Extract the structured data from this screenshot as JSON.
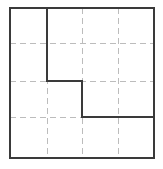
{
  "figure": {
    "canvas": {
      "width": 163,
      "height": 169,
      "background": "#ffffff"
    },
    "colors": {
      "solid_line": "#3a3a3a",
      "dashed_line": "#bcbcbc",
      "fill": "#ffffff"
    },
    "stroke_widths": {
      "solid": 1.6,
      "dashed": 1
    },
    "dash_pattern": "6 4"
  },
  "chart_data": {
    "type": "diagram",
    "title": "",
    "xlabel": "",
    "ylabel": "",
    "grid": true,
    "legend": null,
    "plot_box": {
      "x0": 10,
      "y0": 8,
      "x1": 154,
      "y1": 158
    },
    "grid_columns": 4,
    "grid_rows": 4,
    "grid_vertical_x": [
      47,
      82,
      118
    ],
    "grid_horizontal_y": [
      43,
      81,
      117
    ],
    "outer_square": [
      [
        10,
        8
      ],
      [
        154,
        8
      ],
      [
        154,
        158
      ],
      [
        10,
        158
      ]
    ],
    "staircase_polyline": [
      [
        47,
        8
      ],
      [
        47,
        81
      ],
      [
        82,
        81
      ],
      [
        82,
        117
      ],
      [
        154,
        117
      ]
    ]
  }
}
